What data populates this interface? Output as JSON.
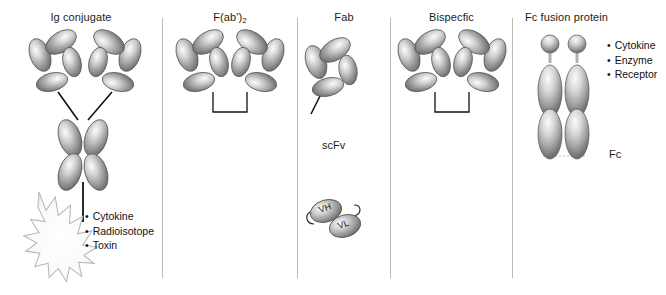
{
  "figure": {
    "width": 666,
    "height": 295,
    "background": "#ffffff",
    "divider_color": "#b9b9b9",
    "protein_fill_light": "#f2f2f2",
    "protein_fill_mid": "#9a9a9a",
    "protein_fill_dark": "#6f6f6f",
    "protein_stroke": "#555555",
    "link_color": "#111111",
    "burst_fill": "#fbfbfb",
    "burst_stroke": "#b5b5b5"
  },
  "panels": [
    {
      "id": "ig-conjugate",
      "title": "Ig conjugate",
      "bullets": [
        "Cytokine",
        "Radioisotope",
        "Toxin"
      ],
      "sublabels": []
    },
    {
      "id": "fab2",
      "title": "F(ab')",
      "title_sub": "2",
      "bullets": [],
      "sublabels": []
    },
    {
      "id": "fab",
      "title": "Fab",
      "bullets": [],
      "sublabels": [
        "scFv"
      ],
      "domain_labels": [
        "VH",
        "VL"
      ]
    },
    {
      "id": "bispecific",
      "title": "Bispecfic",
      "bullets": [],
      "sublabels": []
    },
    {
      "id": "fc-fusion",
      "title": "Fc fusion protein",
      "bullets": [
        "Cytokine",
        "Enzyme",
        "Receptor"
      ],
      "sublabels": [
        "Fc"
      ]
    }
  ]
}
